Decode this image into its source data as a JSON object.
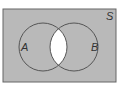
{
  "diagram": {
    "type": "venn",
    "universe_label": "S",
    "sets": [
      {
        "label": "A"
      },
      {
        "label": "B"
      }
    ],
    "shaded_region": "complement of A∩B (everything except the intersection)",
    "colors": {
      "shade": "#b9b9b9",
      "unshaded": "#ffffff",
      "stroke": "#555555"
    }
  }
}
